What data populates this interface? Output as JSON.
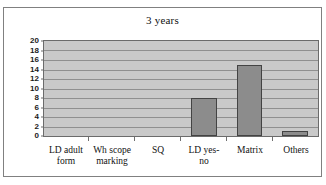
{
  "chart_data": {
    "type": "bar",
    "title": "3 years",
    "xlabel": "",
    "ylabel": "",
    "categories": [
      "LD adult form",
      "Wh scope marking",
      "SQ",
      "LD yes-no",
      "Matrix",
      "Others"
    ],
    "values": [
      0,
      0,
      0,
      8,
      15,
      1
    ],
    "ylim": [
      0,
      20
    ],
    "ytick_step": 2,
    "yticks": [
      "20",
      "18",
      "16",
      "14",
      "12",
      "10",
      "8",
      "6",
      "4",
      "2",
      "0"
    ],
    "grid": true,
    "legend": false,
    "legend_position": "none",
    "series": [
      {
        "name": "3 years",
        "values": [
          0,
          0,
          0,
          8,
          15,
          1
        ]
      }
    ],
    "category_lines": [
      [
        "LD adult",
        "form"
      ],
      [
        "Wh scope",
        "marking"
      ],
      [
        "SQ",
        ""
      ],
      [
        "LD yes-",
        "no"
      ],
      [
        "Matrix",
        ""
      ],
      [
        "Others",
        ""
      ]
    ]
  },
  "style": {
    "plot_background": "#c9c9c9",
    "bar_fill": "#8c8c8c",
    "bar_border": "#434343",
    "gridline": "#8f8f8f",
    "frame_border": "#808080",
    "text": "#111111"
  },
  "clipped_header_text": ""
}
